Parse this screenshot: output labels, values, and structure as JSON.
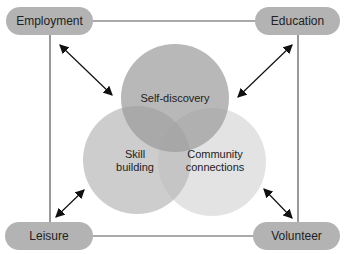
{
  "nodes": {
    "employment": "Employment",
    "education": "Education",
    "leisure": "Leisure",
    "volunteer": "Volunteer"
  },
  "circles": {
    "self_discovery": "Self-discovery",
    "skill_building": "Skill building",
    "community_connections": "Community connections"
  },
  "colors": {
    "pill": "#b3b3b3",
    "top_circle": "#a9a9a9",
    "left_circle": "#c8c8c8",
    "right_circle": "#dedede",
    "line": "#555555"
  }
}
